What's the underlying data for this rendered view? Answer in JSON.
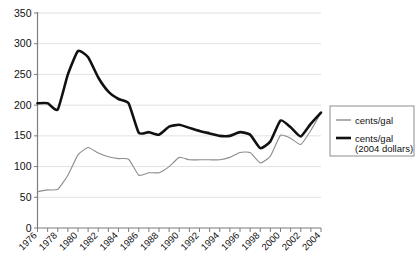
{
  "chart_data": {
    "type": "line",
    "title": "",
    "xlabel": "",
    "ylabel": "",
    "ylim": [
      0,
      350
    ],
    "ytick_step": 50,
    "yticks": [
      "0",
      "50",
      "100",
      "150",
      "200",
      "250",
      "300",
      "350"
    ],
    "xlim": [
      1976,
      2004
    ],
    "xticks_all": [
      1976,
      1977,
      1978,
      1979,
      1980,
      1981,
      1982,
      1983,
      1984,
      1985,
      1986,
      1987,
      1988,
      1989,
      1990,
      1991,
      1992,
      1993,
      1994,
      1995,
      1996,
      1997,
      1998,
      1999,
      2000,
      2001,
      2002,
      2003,
      2004
    ],
    "xtick_labels": [
      "1976",
      "1978",
      "1980",
      "1982",
      "1984",
      "1986",
      "1988",
      "1990",
      "1992",
      "1994",
      "1996",
      "1998",
      "2000",
      "2002",
      "2004"
    ],
    "grid": true,
    "legend_position": "right",
    "x": [
      1976,
      1977,
      1978,
      1979,
      1980,
      1981,
      1982,
      1983,
      1984,
      1985,
      1986,
      1987,
      1988,
      1989,
      1990,
      1991,
      1992,
      1993,
      1994,
      1995,
      1996,
      1997,
      1998,
      1999,
      2000,
      2001,
      2002,
      2003,
      2004
    ],
    "series": [
      {
        "name": "cents/gal",
        "color": "#8d8d8d",
        "values": [
          59,
          62,
          63,
          86,
          119,
          131,
          122,
          116,
          113,
          112,
          86,
          90,
          90,
          100,
          115,
          111,
          111,
          111,
          111,
          115,
          123,
          123,
          106,
          117,
          151,
          146,
          136,
          159,
          188
        ]
      },
      {
        "name": "cents/gal (2004 dollars)",
        "color": "#111111",
        "values": [
          203,
          203,
          193,
          250,
          288,
          278,
          245,
          222,
          210,
          203,
          155,
          156,
          152,
          165,
          168,
          163,
          158,
          154,
          150,
          150,
          156,
          152,
          130,
          141,
          175,
          164,
          149,
          170,
          188
        ]
      }
    ]
  },
  "legend": {
    "entries": [
      {
        "label": "cents/gal",
        "sublabel": ""
      },
      {
        "label": "cents/gal",
        "sublabel": "(2004 dollars)"
      }
    ]
  },
  "caption": {
    "text": ""
  }
}
